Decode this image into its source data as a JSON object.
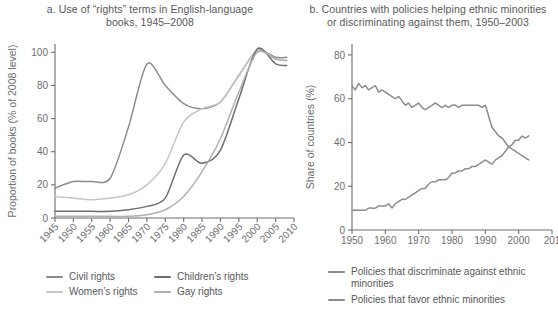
{
  "panel_a": {
    "title_line1": "a. Use of “rights” terms in English-language",
    "title_line2": "books, 1945–2008",
    "legend": [
      {
        "label": "Civil rights",
        "color": "#8c8c8e"
      },
      {
        "label": "Children’s rights",
        "color": "#6e6e70"
      },
      {
        "label": "Women’s rights",
        "color": "#c6c6c8"
      },
      {
        "label": "Gay rights",
        "color": "#b0b0b2"
      }
    ]
  },
  "panel_b": {
    "title_line1": "b. Countries with policies helping ethnic minorities",
    "title_line2": "or discriminating against them, 1950–2003",
    "legend": [
      {
        "label": "Policies that discriminate against ethnic minorities",
        "color": "#8c8c8e"
      },
      {
        "label": "Policies that favor ethnic minorities",
        "color": "#8c8c8e"
      }
    ]
  },
  "chart_data": [
    {
      "type": "line",
      "title": "a. Use of “rights” terms in English-language books, 1945–2008",
      "xlabel": "",
      "ylabel": "Proportion of books (% of 2008 level)",
      "xlim": [
        1945,
        2010
      ],
      "ylim": [
        0,
        105
      ],
      "xticks": [
        1945,
        1950,
        1955,
        1960,
        1965,
        1970,
        1975,
        1980,
        1985,
        1990,
        1995,
        2000,
        2005,
        2010
      ],
      "yticks": [
        0,
        20,
        40,
        60,
        80,
        100
      ],
      "grid": false,
      "legend_position": "below",
      "x": [
        1945,
        1950,
        1955,
        1960,
        1965,
        1970,
        1975,
        1980,
        1985,
        1990,
        1995,
        2000,
        2005,
        2008
      ],
      "series": [
        {
          "name": "Civil rights",
          "color": "#8c8c8e",
          "values": [
            18,
            22,
            22,
            24,
            55,
            93,
            80,
            69,
            66,
            70,
            86,
            101,
            97,
            97
          ]
        },
        {
          "name": "Women’s rights",
          "color": "#c6c6c8",
          "values": [
            13,
            12,
            11,
            12,
            14,
            20,
            33,
            58,
            66,
            70,
            86,
            101,
            96,
            95
          ]
        },
        {
          "name": "Children’s rights",
          "color": "#6e6e70",
          "values": [
            4,
            4,
            4,
            4,
            5,
            7,
            12,
            38,
            33,
            41,
            72,
            102,
            93,
            92
          ]
        },
        {
          "name": "Gay rights",
          "color": "#b0b0b2",
          "values": [
            1,
            1,
            1,
            1,
            1,
            2,
            5,
            13,
            28,
            48,
            76,
            100,
            96,
            95
          ]
        }
      ]
    },
    {
      "type": "line",
      "title": "b. Countries with policies helping ethnic minorities or discriminating against them, 1950–2003",
      "xlabel": "",
      "ylabel": "Share of countries (%)",
      "xlim": [
        1950,
        2010
      ],
      "ylim": [
        0,
        85
      ],
      "xticks": [
        1950,
        1960,
        1970,
        1980,
        1990,
        2000,
        2010
      ],
      "xticklabels": [
        "1950",
        "1960",
        "1970",
        "1980",
        "1990",
        "2000",
        "201"
      ],
      "yticks": [
        0,
        20,
        40,
        60,
        80
      ],
      "grid": false,
      "legend_position": "below",
      "x": [
        1950,
        1951,
        1952,
        1953,
        1954,
        1955,
        1956,
        1957,
        1958,
        1959,
        1960,
        1961,
        1962,
        1963,
        1964,
        1965,
        1966,
        1967,
        1968,
        1969,
        1970,
        1971,
        1972,
        1973,
        1974,
        1975,
        1976,
        1977,
        1978,
        1979,
        1980,
        1981,
        1982,
        1983,
        1984,
        1985,
        1986,
        1987,
        1988,
        1989,
        1990,
        1991,
        1992,
        1993,
        1994,
        1995,
        1996,
        1997,
        1998,
        1999,
        2000,
        2001,
        2002,
        2003
      ],
      "series": [
        {
          "name": "Policies that discriminate against ethnic minorities",
          "color": "#8c8c8e",
          "values": [
            66,
            64,
            67,
            65,
            66,
            64,
            65,
            66,
            63,
            64,
            63,
            62,
            61,
            60,
            61,
            59,
            57,
            58,
            56,
            57,
            58,
            56,
            55,
            56,
            57,
            58,
            57,
            56,
            57,
            56,
            57,
            57,
            56,
            57,
            57,
            57,
            57,
            57,
            57,
            56,
            57,
            52,
            47,
            45,
            43,
            42,
            40,
            38,
            37,
            36,
            35,
            34,
            33,
            32
          ]
        },
        {
          "name": "Policies that favor ethnic minorities",
          "color": "#8c8c8e",
          "values": [
            9,
            9,
            9,
            9,
            9,
            10,
            10,
            10,
            11,
            11,
            11,
            12,
            10,
            12,
            13,
            14,
            14,
            15,
            16,
            17,
            18,
            19,
            19,
            21,
            22,
            22,
            23,
            23,
            23,
            24,
            26,
            26,
            27,
            27,
            28,
            28,
            29,
            29,
            30,
            31,
            32,
            31,
            30,
            32,
            33,
            34,
            36,
            38,
            39,
            41,
            41,
            43,
            42,
            43
          ]
        }
      ]
    }
  ]
}
